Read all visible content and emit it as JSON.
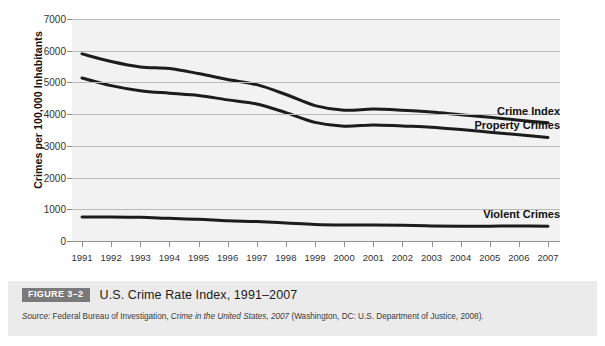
{
  "figure": {
    "badge": "FIGURE 3–2",
    "title": "U.S. Crime Rate Index, 1991–2007",
    "source_prefix": "Source:",
    "source_part1": " Federal Bureau of Investigation, ",
    "source_italic": "Crime in the United States, 2007",
    "source_part2": " (Washington, DC: U.S. Department of Justice, 2008)."
  },
  "chart_data": {
    "type": "line",
    "title": "U.S. Crime Rate Index, 1991–2007",
    "xlabel": "",
    "ylabel": "Crimes per 100,000 Inhabitants",
    "ylim": [
      0,
      7000
    ],
    "ytick_values": [
      0,
      1000,
      2000,
      3000,
      4000,
      5000,
      6000,
      7000
    ],
    "ytick_labels": [
      "0",
      "1000",
      "2000",
      "3000",
      "4000",
      "5000",
      "6000",
      "7000"
    ],
    "grid": true,
    "legend_position": "right-inline",
    "categories": [
      "1991",
      "1992",
      "1993",
      "1994",
      "1995",
      "1996",
      "1997",
      "1998",
      "1999",
      "2000",
      "2001",
      "2002",
      "2003",
      "2004",
      "2005",
      "2006",
      "2007"
    ],
    "series": [
      {
        "name": "Crime Index",
        "color": "#1c1c1c",
        "values": [
          5900,
          5660,
          5490,
          5440,
          5280,
          5090,
          4930,
          4620,
          4270,
          4125,
          4160,
          4125,
          4065,
          3980,
          3900,
          3810,
          3730
        ]
      },
      {
        "name": "Property Crimes",
        "color": "#1c1c1c",
        "values": [
          5140,
          4900,
          4740,
          4660,
          4590,
          4450,
          4320,
          4050,
          3740,
          3620,
          3660,
          3625,
          3590,
          3515,
          3430,
          3350,
          3265
        ]
      },
      {
        "name": "Violent Crimes",
        "color": "#1c1c1c",
        "values": [
          758,
          758,
          747,
          714,
          685,
          637,
          611,
          568,
          523,
          507,
          505,
          495,
          476,
          465,
          469,
          474,
          467
        ]
      }
    ]
  }
}
